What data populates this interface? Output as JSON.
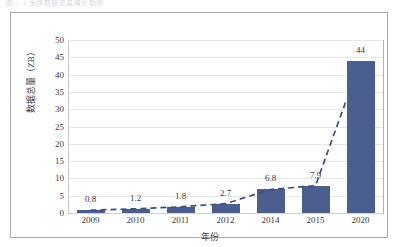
{
  "figure": {
    "top_clipped_caption": "图 1-1  全球数据总量增长趋势",
    "frame_border_color": "#a9a9ad"
  },
  "chart_data": {
    "type": "bar",
    "title": "",
    "subtitle": "",
    "xlabel": "年份",
    "ylabel": "数据总量（ZB）",
    "categories": [
      "2009",
      "2010",
      "2011",
      "2012",
      "2014",
      "2015",
      "2020"
    ],
    "values": [
      0.8,
      1.2,
      1.8,
      2.7,
      6.8,
      7.9,
      44
    ],
    "data_labels": [
      "0.8",
      "1.2",
      "1.8",
      "2.7",
      "6.8",
      "7.9",
      "44"
    ],
    "ylim": [
      0,
      50
    ],
    "ytick_labels": [
      "50",
      "45",
      "40",
      "35",
      "30",
      "25",
      "20",
      "15",
      "10",
      "5",
      "0"
    ],
    "ytick_values": [
      50,
      45,
      40,
      35,
      30,
      25,
      20,
      15,
      10,
      5,
      0
    ],
    "ytick_step": 5,
    "grid": "horizontal",
    "legend": "none",
    "series": [
      {
        "name": "数据总量",
        "kind": "bar",
        "color": "#4a5f8e",
        "values": [
          0.8,
          1.2,
          1.8,
          2.7,
          6.8,
          7.9,
          44
        ]
      },
      {
        "name": "趋势线",
        "kind": "line",
        "style": "dashed",
        "color": "#3b4f7d",
        "values": [
          0.8,
          1.2,
          1.8,
          2.7,
          6.8,
          7.9,
          44
        ]
      }
    ],
    "colors": {
      "bar": "#4a5f8e",
      "trendline": "#3b4f7d",
      "grid": "#e6e6e8",
      "axis": "#c9c9cd",
      "text": "#3a3a3a"
    }
  }
}
